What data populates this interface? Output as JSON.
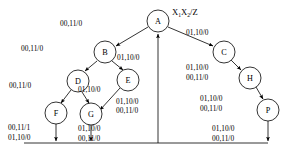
{
  "diagram": {
    "kind": "state-transition-diagram",
    "title": "X1X2/Z",
    "title_parts": {
      "x1": "X",
      "x1_sub": "1",
      "x2": "X",
      "x2_sub": "2",
      "z": "/Z"
    },
    "background": "#ffffff",
    "stroke_color": "#000000",
    "nodes": [
      {
        "id": "A",
        "label": "A",
        "cx": 158,
        "cy": 21,
        "r": 11
      },
      {
        "id": "B",
        "label": "B",
        "cx": 105,
        "cy": 52,
        "r": 11
      },
      {
        "id": "C",
        "label": "C",
        "cx": 224,
        "cy": 52,
        "r": 11
      },
      {
        "id": "D",
        "label": "D",
        "cx": 78,
        "cy": 81,
        "r": 11
      },
      {
        "id": "E",
        "label": "E",
        "cx": 128,
        "cy": 80,
        "r": 11
      },
      {
        "id": "F",
        "label": "F",
        "cx": 56,
        "cy": 113,
        "r": 11
      },
      {
        "id": "G",
        "label": "G",
        "cx": 91,
        "cy": 114,
        "r": 11
      },
      {
        "id": "H",
        "label": "H",
        "cx": 250,
        "cy": 78,
        "r": 11
      },
      {
        "id": "P",
        "label": "P",
        "cx": 268,
        "cy": 110,
        "r": 11
      }
    ],
    "edges": [
      {
        "id": "A-B",
        "from": "A",
        "to": "B",
        "labels": [
          "00,11/0"
        ],
        "label_x": 60,
        "label_y": 26
      },
      {
        "id": "A-C",
        "from": "A",
        "to": "C",
        "labels": [
          "01,10/0"
        ],
        "label_x": 186,
        "label_y": 35
      },
      {
        "id": "B-D",
        "from": "B",
        "to": "D",
        "labels": [
          "00,11/0"
        ],
        "label_x": 21,
        "label_y": 51
      },
      {
        "id": "B-E",
        "from": "B",
        "to": "E",
        "labels": [
          "01,10/0"
        ],
        "label_x": 117,
        "label_y": 60
      },
      {
        "id": "D-F",
        "from": "D",
        "to": "F",
        "labels": [
          "00,11/0"
        ],
        "label_x": 9,
        "label_y": 88
      },
      {
        "id": "D-G",
        "from": "D",
        "to": "G",
        "labels": [
          "01,10/0"
        ],
        "label_x": 78,
        "label_y": 92
      },
      {
        "id": "E-G",
        "from": "E",
        "to": "G",
        "labels": [
          "01,10/0",
          "00,11/0"
        ],
        "label_x": 116,
        "label_y": 104
      },
      {
        "id": "C-H",
        "from": "C",
        "to": "H",
        "labels": [
          "01,10/0",
          "00,11/0"
        ],
        "label_x": 186,
        "label_y": 70
      },
      {
        "id": "H-P",
        "from": "H",
        "to": "P",
        "labels": [
          "01,10/0",
          "00,11/0"
        ],
        "label_x": 200,
        "label_y": 101
      },
      {
        "id": "F-A",
        "from": "F",
        "to": "A",
        "labels": [
          "00,11/1",
          "01,10/0"
        ],
        "label_x": 8,
        "label_y": 130
      },
      {
        "id": "G-A",
        "from": "G",
        "to": "A",
        "labels": [
          "01,10/0",
          "00,11/0"
        ],
        "label_x": 78,
        "label_y": 130
      },
      {
        "id": "P-A",
        "from": "P",
        "to": "A",
        "labels": [
          "01,10/0",
          "00,11/0"
        ],
        "label_x": 212,
        "label_y": 130
      }
    ],
    "return_bus": {
      "y": 143,
      "x_start": 24,
      "x_end": 268,
      "riser_x": 158
    }
  }
}
